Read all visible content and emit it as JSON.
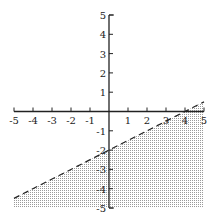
{
  "chart_data": {
    "type": "area",
    "title": "",
    "xlabel": "",
    "ylabel": "",
    "xlim": [
      -5,
      5
    ],
    "ylim": [
      -5,
      5
    ],
    "x_ticks": [
      -5,
      -4,
      -3,
      -2,
      -1,
      1,
      2,
      3,
      4,
      5
    ],
    "y_ticks": [
      5,
      4,
      3,
      2,
      1,
      -1,
      -2,
      -3,
      -4,
      -5
    ],
    "x_tick_labels": [
      "-5",
      "-4",
      "-3",
      "-2",
      "-1",
      "1",
      "2",
      "3",
      "4",
      "5"
    ],
    "y_tick_labels": [
      "5",
      "4",
      "3",
      "2",
      "1",
      "-1",
      "-2",
      "-3",
      "-4",
      "-5"
    ],
    "grid": false,
    "boundary_line": {
      "equation": "y = 0.5x - 2",
      "slope": 0.5,
      "intercept": -2,
      "style": "dashed",
      "x_range": [
        -5,
        5
      ]
    },
    "shaded_region": {
      "inequality": "y < 0.5x - 2",
      "side": "below",
      "pattern": "dotted",
      "bounds": {
        "x": [
          -5,
          5
        ],
        "y_min": -5
      }
    }
  },
  "colors": {
    "axis": "#222222",
    "line": "#222222",
    "shade_dot": "#9a9a9a"
  }
}
